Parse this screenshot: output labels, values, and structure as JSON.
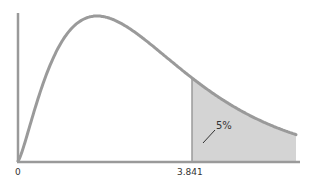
{
  "chart_data": {
    "type": "area",
    "title": "",
    "xlabel": "",
    "ylabel": "",
    "x_tick_labels": [
      "0",
      "3.841"
    ],
    "critical_value": 3.841,
    "tail_area_label": "5%",
    "tail_area": 0.05,
    "grid": false,
    "legend": null,
    "colors": {
      "curve": "#9a9a9a",
      "axis": "#9a9a9a",
      "shade": "#d4d4d4",
      "text": "#333333"
    }
  },
  "labels": {
    "origin": "0",
    "critical": "3.841",
    "tail": "5%"
  }
}
